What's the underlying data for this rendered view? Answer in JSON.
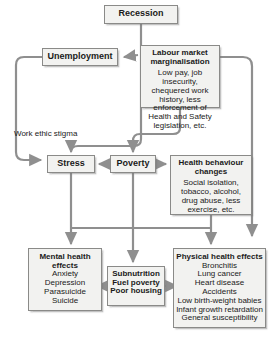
{
  "diagram": {
    "colors": {
      "box_fill": "#f2f2f0",
      "box_border": "#8a8a88",
      "connector": "#8f8f8f",
      "text": "#1a1a1a",
      "background": "#ffffff"
    },
    "nodes": {
      "recession": {
        "header": "Recession"
      },
      "unemployment": {
        "header": "Unemployment"
      },
      "labour_market_marginalisation": {
        "header": "Labour market marginalisation",
        "detail": "Low pay, job insecurity, chequered work history, less enforcement of Health and Safety legislation, etc."
      },
      "stress": {
        "header": "Stress"
      },
      "poverty": {
        "header": "Poverty"
      },
      "health_behaviour_changes": {
        "header": "Health behaviour changes",
        "detail": "Social isolation, tobacco, alcohol, drug abuse, less exercise, etc."
      },
      "mental_health_effects": {
        "header": "Mental health effects",
        "items": [
          "Anxiety",
          "Depression",
          "Parasuicide",
          "Suicide"
        ]
      },
      "subnutrition": {
        "items": [
          "Subnutrition",
          "Fuel poverty",
          "Poor housing"
        ]
      },
      "physical_health_effects": {
        "header": "Physical health effects",
        "items": [
          "Bronchitis",
          "Lung cancer",
          "Heart disease",
          "Accidents",
          "Low birth-weight babies",
          "Infant growth retardation",
          "General susceptibility"
        ]
      }
    },
    "labels": {
      "work_ethic_stigma": "Work ethic stigma"
    },
    "edges": [
      {
        "from": "recession",
        "to": "unemployment"
      },
      {
        "from": "recession",
        "to": "labour_market_marginalisation"
      },
      {
        "from": "recession",
        "to": "stress"
      },
      {
        "from": "unemployment",
        "to": "stress"
      },
      {
        "from": "poverty",
        "to": "stress"
      },
      {
        "from": "poverty",
        "to": "health_behaviour_changes"
      },
      {
        "from": "labour_market_marginalisation",
        "to": "poverty"
      },
      {
        "from": "labour_market_marginalisation",
        "to": "health_behaviour_changes"
      },
      {
        "from": "stress",
        "to": "mental_health_effects"
      },
      {
        "from": "poverty",
        "to": "subnutrition"
      },
      {
        "from": "health_behaviour_changes",
        "to": "physical_health_effects"
      },
      {
        "from": "subnutrition",
        "to": "mental_health_effects"
      },
      {
        "from": "subnutrition",
        "to": "physical_health_effects"
      },
      {
        "from": "stress",
        "to": "physical_health_effects"
      }
    ]
  }
}
